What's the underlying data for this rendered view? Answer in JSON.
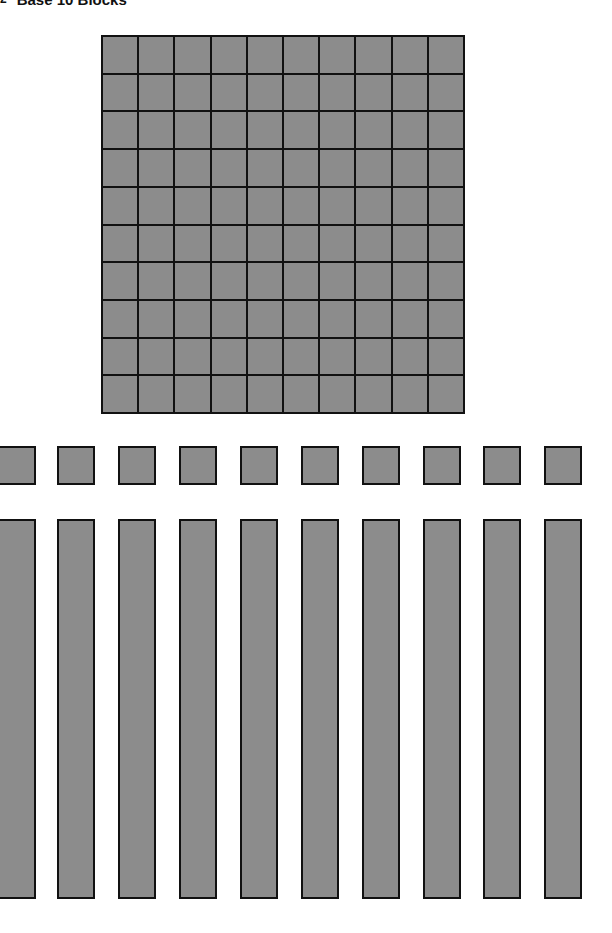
{
  "title": {
    "marker": "2",
    "text": "Base 10 Blocks"
  },
  "colors": {
    "block_fill": "#8c8c8c",
    "block_border": "#111111",
    "background": "#ffffff"
  },
  "diagram": {
    "hundred_flat": {
      "rows": 10,
      "columns": 10,
      "count": 1
    },
    "units": {
      "count": 10,
      "x_positions": [
        -2,
        57,
        118,
        179,
        240,
        301,
        362,
        423,
        483,
        544
      ]
    },
    "rods": {
      "count": 10,
      "cells_each": 10,
      "x_positions": [
        -2,
        57,
        118,
        179,
        240,
        301,
        362,
        423,
        483,
        544
      ]
    }
  }
}
